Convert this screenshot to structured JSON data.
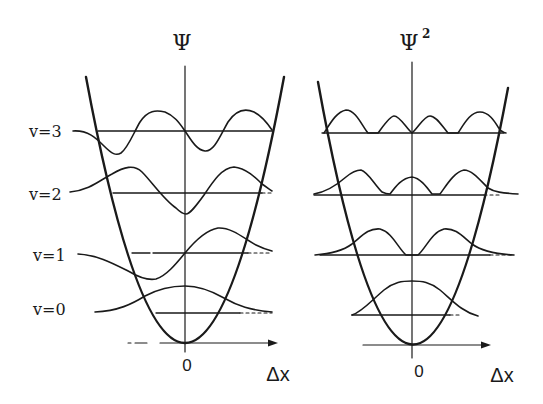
{
  "left_panel": {
    "axis_label": "Ψ",
    "x_label": "Δx",
    "origin_label": "0",
    "levels": [
      {
        "label": "v=3",
        "n": 3
      },
      {
        "label": "v=2",
        "n": 2
      },
      {
        "label": "v=1",
        "n": 1
      },
      {
        "label": "v=0",
        "n": 0
      }
    ]
  },
  "right_panel": {
    "axis_label": "Ψ",
    "axis_superscript": "2",
    "x_label": "Δx",
    "origin_label": "0"
  },
  "colors": {
    "ink": "#1a1a1a",
    "background": "#ffffff"
  }
}
